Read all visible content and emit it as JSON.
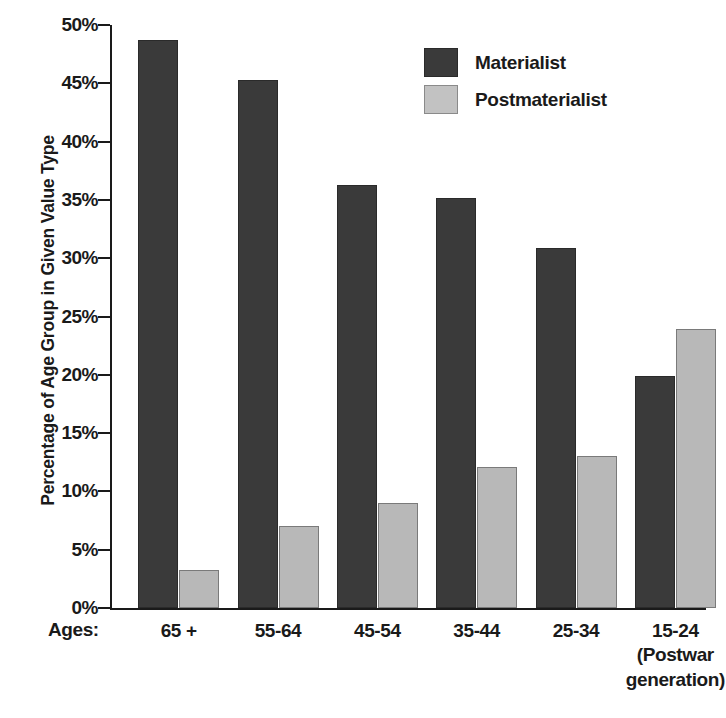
{
  "chart_data": {
    "type": "bar",
    "title": "",
    "subtitle": "",
    "xlabel": "Ages:",
    "ylabel": "Percentage of Age Group in Given Value Type",
    "categories": [
      "65 +",
      "55-64",
      "45-54",
      "35-44",
      "25-34",
      "15-24"
    ],
    "category_sublabels": [
      "",
      "",
      "",
      "",
      "",
      "(Postwar\ngeneration)"
    ],
    "series": [
      {
        "name": "Materialist",
        "color": "#3a3a3a",
        "values": [
          48.7,
          45.3,
          36.3,
          35.2,
          30.9,
          19.9
        ]
      },
      {
        "name": "Postmaterialist",
        "color": "#b8b8b8",
        "values": [
          3.3,
          7.0,
          9.0,
          12.1,
          13.0,
          23.9
        ]
      }
    ],
    "ylim": [
      0,
      50
    ],
    "ytick_values": [
      0,
      5,
      10,
      15,
      20,
      25,
      30,
      35,
      40,
      45,
      50
    ],
    "ytick_labels": [
      "0%",
      "5%",
      "10%",
      "15%",
      "20%",
      "25%",
      "30%",
      "35%",
      "40%",
      "45%",
      "50%"
    ],
    "grid": false,
    "legend_position": "top-right",
    "orientation": "vertical",
    "bar_group_mode": "grouped"
  },
  "legend": {
    "items": [
      {
        "label": "Materialist",
        "color": "#3a3a3a"
      },
      {
        "label": "Postmaterialist",
        "color": "#c2c2c2"
      }
    ]
  },
  "axes": {
    "y_title": "Percentage of Age Group in Given Value Type",
    "x_prefix": "Ages:"
  },
  "colors": {
    "materialist": "#3a3a3a",
    "postmaterialist": "#b8b8b8",
    "axis": "#1a1a1a",
    "background": "#ffffff"
  }
}
